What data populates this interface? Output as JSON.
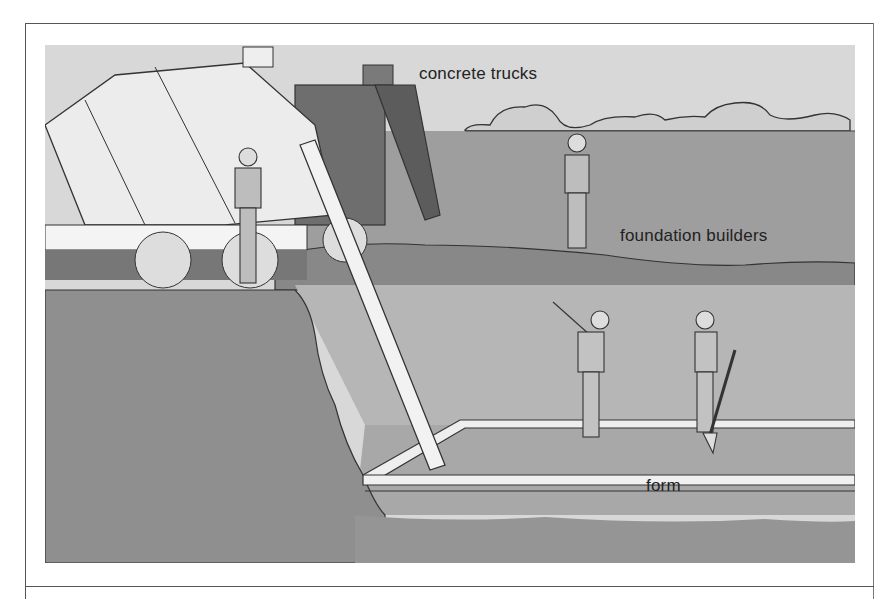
{
  "figure": {
    "labels": {
      "trucks": "concrete trucks",
      "builders": "foundation builders",
      "form": "form"
    }
  },
  "colors": {
    "sky": "#d8d8d8",
    "field": "#9a9a9a",
    "soil_dark": "#8e8e8e",
    "pit_wall": "#b4b4b4",
    "pit_floor": "#a6a6a6",
    "truck_body": "#ececec",
    "truck_dark": "#6e6e6e",
    "line": "#333333"
  }
}
